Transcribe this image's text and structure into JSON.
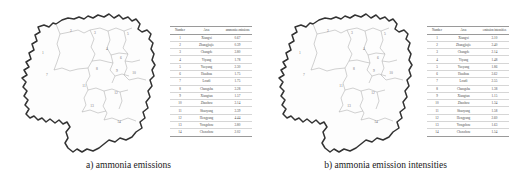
{
  "figure": {
    "panels": [
      {
        "id": "panel-a",
        "caption": "a) ammonia emissions",
        "map": {
          "name": "hunan-province-map",
          "regions": 14
        },
        "table": {
          "headers": [
            "Number",
            "Area",
            "ammonia emissions"
          ],
          "rows": [
            {
              "number": "1",
              "area": "Xiangxi",
              "value": "0.67"
            },
            {
              "number": "2",
              "area": "Zhangjiajie",
              "value": "0.39"
            },
            {
              "number": "3",
              "area": "Changde",
              "value": "3.80"
            },
            {
              "number": "4",
              "area": "Yiyang",
              "value": "1.78"
            },
            {
              "number": "5",
              "area": "Yueyang",
              "value": "2.30"
            },
            {
              "number": "6",
              "area": "Huaihua",
              "value": "1.75"
            },
            {
              "number": "7",
              "area": "Loudi",
              "value": "1.75"
            },
            {
              "number": "8",
              "area": "Changsha",
              "value": "3.28"
            },
            {
              "number": "9",
              "area": "Xiangtan",
              "value": "1.57"
            },
            {
              "number": "10",
              "area": "Zhuzhou",
              "value": "3.14"
            },
            {
              "number": "11",
              "area": "Shaoyang",
              "value": "3.39"
            },
            {
              "number": "12",
              "area": "Hengyang",
              "value": "4.44"
            },
            {
              "number": "13",
              "area": "Yongzhou",
              "value": "3.80"
            },
            {
              "number": "14",
              "area": "Chenzhou",
              "value": "2.02"
            }
          ]
        }
      },
      {
        "id": "panel-b",
        "caption": "b) ammonia emission intensities",
        "map": {
          "name": "hunan-province-map",
          "regions": 14
        },
        "table": {
          "headers": [
            "Number",
            "Area",
            "emission intensities"
          ],
          "rows": [
            {
              "number": "1",
              "area": "Xiangxi",
              "value": "3.10"
            },
            {
              "number": "2",
              "area": "Zhangjiajie",
              "value": "3.40"
            },
            {
              "number": "3",
              "area": "Changde",
              "value": "2.14"
            },
            {
              "number": "4",
              "area": "Yiyang",
              "value": "1.48"
            },
            {
              "number": "5",
              "area": "Yueyang",
              "value": "1.86"
            },
            {
              "number": "6",
              "area": "Huaihua",
              "value": "3.62"
            },
            {
              "number": "7",
              "area": "Loudi",
              "value": "2.55"
            },
            {
              "number": "8",
              "area": "Changsha",
              "value": "1.38"
            },
            {
              "number": "9",
              "area": "Xiangtan",
              "value": "1.15"
            },
            {
              "number": "10",
              "area": "Zhuzhou",
              "value": "1.34"
            },
            {
              "number": "11",
              "area": "Shaoyang",
              "value": "1.58"
            },
            {
              "number": "12",
              "area": "Hengyang",
              "value": "2.60"
            },
            {
              "number": "13",
              "area": "Yongzhou",
              "value": "1.63"
            },
            {
              "number": "14",
              "area": "Chenzhou",
              "value": "1.54"
            }
          ]
        }
      }
    ],
    "map_region_labels": [
      {
        "n": "2",
        "x": 55,
        "y": 26
      },
      {
        "n": "3",
        "x": 79,
        "y": 28
      },
      {
        "n": "5",
        "x": 112,
        "y": 29
      },
      {
        "n": "1",
        "x": 27,
        "y": 48
      },
      {
        "n": "4",
        "x": 91,
        "y": 44
      },
      {
        "n": "6",
        "x": 105,
        "y": 53
      },
      {
        "n": "9",
        "x": 101,
        "y": 66
      },
      {
        "n": "10",
        "x": 118,
        "y": 68
      },
      {
        "n": "7",
        "x": 31,
        "y": 70
      },
      {
        "n": "8",
        "x": 81,
        "y": 64
      },
      {
        "n": "11",
        "x": 68,
        "y": 81
      },
      {
        "n": "12",
        "x": 100,
        "y": 88
      },
      {
        "n": "13",
        "x": 76,
        "y": 101
      },
      {
        "n": "14",
        "x": 103,
        "y": 117
      }
    ],
    "colors": {
      "outline": "#333333",
      "subdivision": "#aaaaaa",
      "fill": "#fdfdfd",
      "text": "#1a1a1a",
      "table_rule": "#9a9a9a",
      "background": "#ffffff"
    }
  }
}
